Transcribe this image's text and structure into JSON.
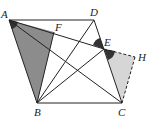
{
  "diagram": {
    "type": "geometry",
    "points": {
      "A": {
        "label": "A",
        "x": 9,
        "y": 20
      },
      "D": {
        "label": "D",
        "x": 94,
        "y": 20
      },
      "F": {
        "label": "F",
        "x": 54,
        "y": 32
      },
      "E": {
        "label": "E",
        "x": 104,
        "y": 49
      },
      "H": {
        "label": "H",
        "x": 135,
        "y": 57
      },
      "B": {
        "label": "B",
        "x": 37,
        "y": 103
      },
      "C": {
        "label": "C",
        "x": 122,
        "y": 103
      }
    },
    "segments": [
      "AD",
      "DC",
      "BC",
      "AB",
      "AC",
      "BD",
      "BE",
      "AE",
      "BF"
    ],
    "dashed_segments": [
      "EH",
      "HC"
    ],
    "shaded_regions": [
      {
        "vertices": [
          "A",
          "B",
          "F"
        ],
        "color": "#8c8c8c"
      },
      {
        "vertices": [
          "E",
          "C",
          "H"
        ],
        "color": "#d6d6d6"
      }
    ],
    "angle_marks": [
      {
        "vertex": "A",
        "color": "#333333"
      },
      {
        "vertex": "E",
        "side": "DEA",
        "color": "#333333"
      },
      {
        "vertex": "E",
        "side": "CEH",
        "color": "#333333"
      }
    ]
  }
}
